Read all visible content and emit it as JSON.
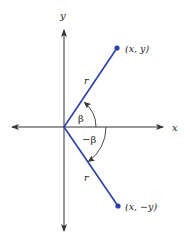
{
  "diagram": {
    "axes": {
      "x_label": "x",
      "y_label": "y"
    },
    "points": [
      {
        "id": "p1",
        "label": "(x, y)"
      },
      {
        "id": "p2",
        "label": "(x, −y)"
      }
    ],
    "segments": [
      {
        "id": "r_upper",
        "label": "r"
      },
      {
        "id": "r_lower",
        "label": "r"
      }
    ],
    "angles": [
      {
        "id": "beta",
        "label": "β"
      },
      {
        "id": "neg_beta",
        "label": "−β"
      }
    ],
    "colors": {
      "axis": "#333333",
      "ray": "#2b3fa8",
      "point": "#2b3fa8",
      "arc": "#333333",
      "text": "#222222"
    }
  }
}
